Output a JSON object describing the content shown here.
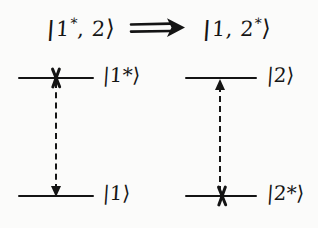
{
  "figure": {
    "kind": "hand-drawn-energy-level-diagram",
    "background_color": "#fbfbfa",
    "ink_color": "#141414"
  },
  "title": {
    "initial_state": {
      "open": "|",
      "text": "1",
      "star": "*",
      "rest": ", 2",
      "close": "⟩",
      "full": "|1*, 2⟩"
    },
    "relation_symbol": "⟹",
    "relation_name": "implies-double-arrow",
    "final_state": {
      "open": "|",
      "text": "1, 2",
      "star": "*",
      "rest": "",
      "close": "⟩",
      "full": "|1, 2*⟩"
    },
    "full": "|1*, 2⟩ ⟹ |1, 2*⟩"
  },
  "diagrams": [
    {
      "id": "left",
      "name": "donor-deexcitation",
      "upper_level": {
        "label_open": "|",
        "label_text": "1",
        "label_star": "*",
        "label_close": "⟩",
        "label_full": "|1*⟩",
        "marker": "x-mark",
        "occupied": true
      },
      "lower_level": {
        "label_open": "|",
        "label_text": "1",
        "label_star": "",
        "label_close": "⟩",
        "label_full": "|1⟩",
        "marker": "none",
        "occupied": false
      },
      "transition": {
        "style": "dashed",
        "direction": "down",
        "from": "|1*⟩",
        "to": "|1⟩"
      }
    },
    {
      "id": "right",
      "name": "acceptor-excitation",
      "upper_level": {
        "label_open": "|",
        "label_text": "2",
        "label_star": "",
        "label_close": "⟩",
        "label_full": "|2⟩",
        "marker": "none",
        "occupied": false
      },
      "lower_level": {
        "label_open": "|",
        "label_text": "2",
        "label_star": "*",
        "label_close": "⟩",
        "label_full": "|2*⟩",
        "marker": "x-mark",
        "occupied": true
      },
      "transition": {
        "style": "dashed",
        "direction": "up",
        "from": "|2*⟩",
        "to": "|2⟩"
      }
    }
  ]
}
